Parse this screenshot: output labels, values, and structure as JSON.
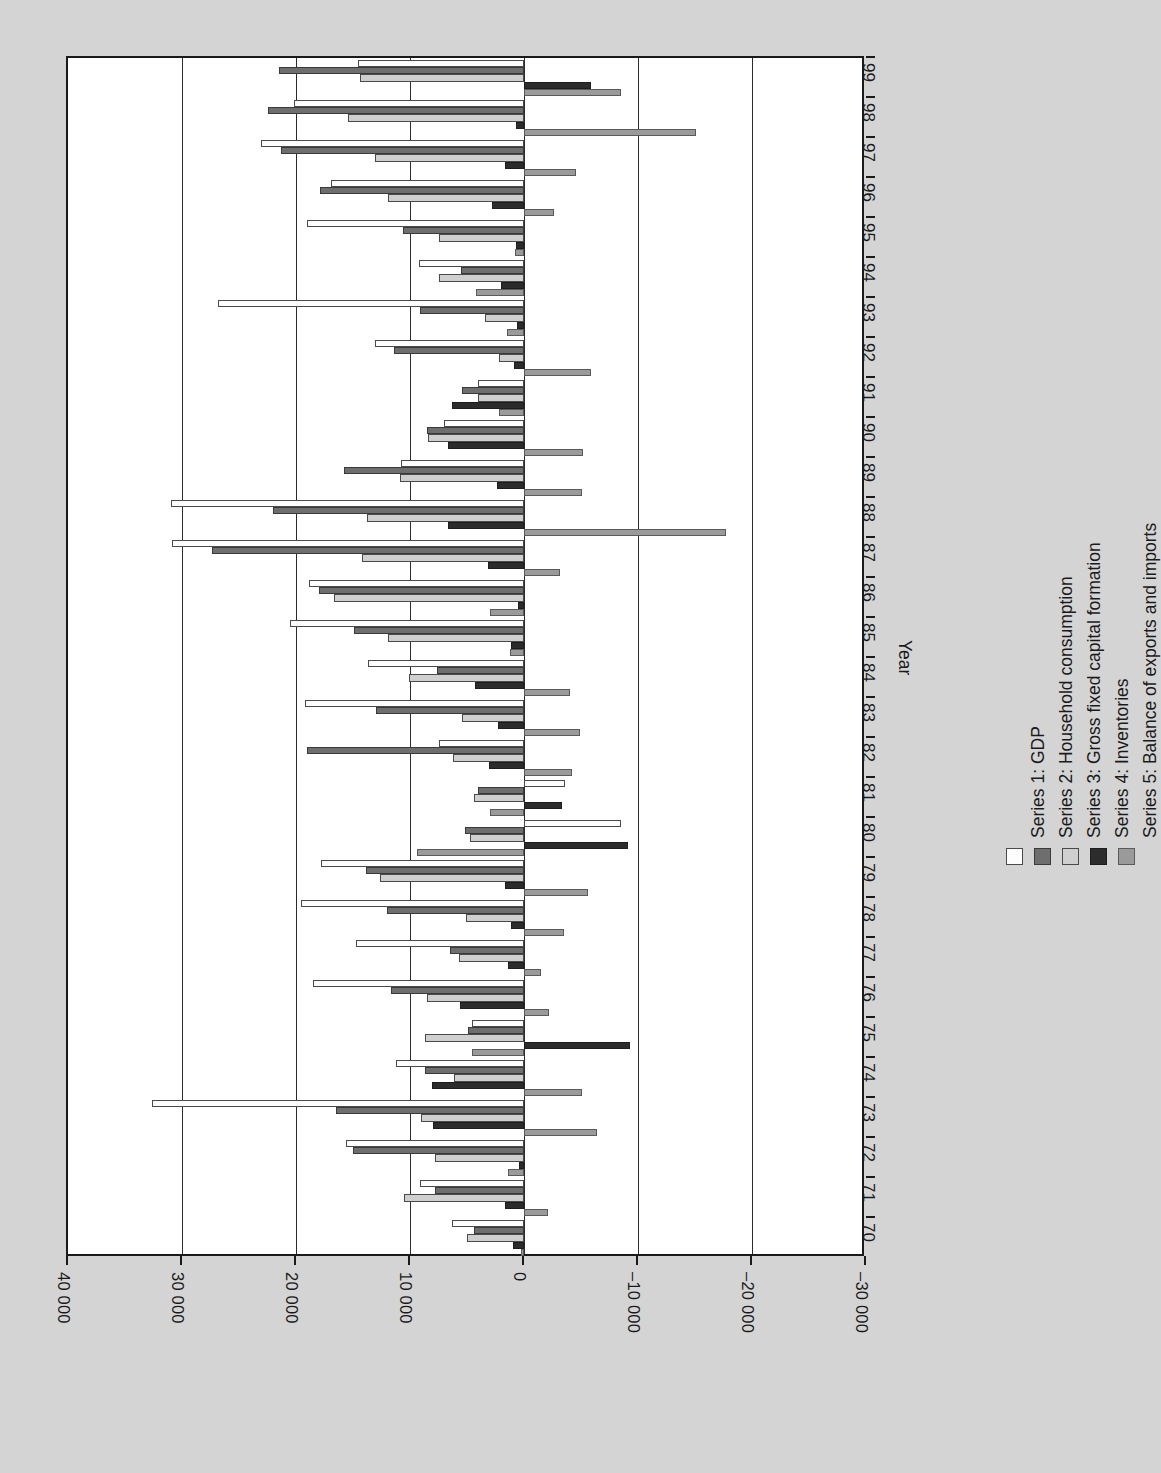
{
  "page": {
    "background_color": "#d4d4d4",
    "orientation": "rotated-90"
  },
  "axis": {
    "category_title": "Year",
    "value_ticks": [
      "40 000",
      "30 000",
      "20 000",
      "10 000",
      "0",
      "–10 000",
      "–20 000",
      "–30 000"
    ],
    "value_tick_numbers": [
      40000,
      30000,
      20000,
      10000,
      0,
      -10000,
      -20000,
      -30000
    ],
    "category_ticks": [
      "70",
      "71",
      "72",
      "73",
      "74",
      "75",
      "76",
      "77",
      "78",
      "79",
      "80",
      "81",
      "82",
      "83",
      "84",
      "85",
      "86",
      "87",
      "88",
      "89",
      "90",
      "91",
      "92",
      "93",
      "94",
      "95",
      "96",
      "97",
      "98",
      "99"
    ]
  },
  "legend": {
    "position": "right",
    "entries": [
      {
        "label": "Series 1: GDP",
        "color": "#fdfdfd",
        "border": "#4a4a4a"
      },
      {
        "label": "Series 2: Household consumption",
        "color": "#6e6e6e",
        "border": "#3a3a3a"
      },
      {
        "label": "Series 3: Gross fixed capital formation",
        "color": "#cfcfcf",
        "border": "#4a4a4a"
      },
      {
        "label": "Series 4: Inventories",
        "color": "#2c2c2c",
        "border": "#1d1d1d"
      },
      {
        "label": "Series 5: Balance of exports and imports",
        "color": "#9a9a9a",
        "border": "#5a5a5a"
      }
    ]
  },
  "chart_data": {
    "type": "bar",
    "orientation": "horizontal-grouped-rotated",
    "title": "",
    "xlabel": "Year",
    "ylabel": "",
    "ylim": [
      -30000,
      40000
    ],
    "grid": true,
    "legend_position": "right",
    "categories": [
      "70",
      "71",
      "72",
      "73",
      "74",
      "75",
      "76",
      "77",
      "78",
      "79",
      "80",
      "81",
      "82",
      "83",
      "84",
      "85",
      "86",
      "87",
      "88",
      "89",
      "90",
      "91",
      "92",
      "93",
      "94",
      "95",
      "96",
      "97",
      "98",
      "99"
    ],
    "series": [
      {
        "name": "Series 1: GDP",
        "color": "#fdfdfd",
        "values": [
          6300,
          9100,
          15600,
          32600,
          11200,
          4600,
          18500,
          14700,
          19600,
          17800,
          -8500,
          -3600,
          7500,
          19200,
          13700,
          20500,
          18900,
          30900,
          31000,
          10800,
          7000,
          4000,
          13100,
          26800,
          9200,
          19000,
          16900,
          23100,
          20200,
          14600
        ]
      },
      {
        "name": "Series 2: Household consumption",
        "color": "#6e6e6e",
        "values": [
          4400,
          7800,
          15000,
          16500,
          8700,
          4900,
          11700,
          6500,
          12000,
          13900,
          5200,
          4000,
          19000,
          13000,
          7600,
          14900,
          18000,
          27400,
          22000,
          15800,
          8500,
          5400,
          11400,
          9100,
          5500,
          10600,
          17900,
          21300,
          22500,
          21500
        ]
      },
      {
        "name": "Series 3: Gross fixed capital formation",
        "color": "#cfcfcf",
        "values": [
          5000,
          10500,
          7800,
          9000,
          6100,
          8700,
          8500,
          5700,
          5100,
          12600,
          4700,
          4400,
          6200,
          5400,
          10100,
          11900,
          16700,
          14200,
          13800,
          10900,
          8400,
          4000,
          2200,
          3400,
          7500,
          7500,
          11900,
          13100,
          15400,
          14400
        ]
      },
      {
        "name": "Series 4: Inventories",
        "color": "#2c2c2c",
        "values": [
          1000,
          1700,
          400,
          8000,
          8100,
          -9300,
          5600,
          1400,
          1100,
          1700,
          -9100,
          -3300,
          3100,
          2300,
          4300,
          1100,
          500,
          3200,
          6700,
          2400,
          6700,
          6300,
          900,
          600,
          2000,
          700,
          2800,
          1700,
          700,
          -5900
        ]
      },
      {
        "name": "Series 5: Balance of exports and imports",
        "color": "#9a9a9a",
        "values": [
          300,
          -2100,
          1400,
          -6400,
          -5100,
          4600,
          -2200,
          -1500,
          -3500,
          -5600,
          9400,
          3000,
          -4200,
          -4900,
          -4000,
          1200,
          3000,
          -3200,
          -17700,
          -5100,
          -5200,
          2200,
          -5900,
          1500,
          4200,
          800,
          -2600,
          -4600,
          -15100,
          -8500
        ]
      }
    ]
  }
}
